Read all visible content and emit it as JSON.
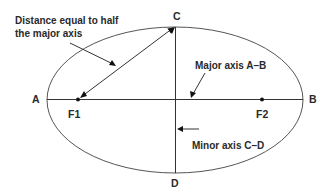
{
  "diagram": {
    "colors": {
      "stroke": "#555555",
      "text": "#2a2a2a",
      "background": "#ffffff"
    },
    "points": {
      "A": "A",
      "B": "B",
      "C": "C",
      "D": "D",
      "F1": "F1",
      "F2": "F2"
    },
    "annotations": {
      "half_major_line1": "Distance equal to half",
      "half_major_line2": "the major axis",
      "major_axis": "Major axis A–B",
      "minor_axis": "Minor axis C–D"
    }
  }
}
